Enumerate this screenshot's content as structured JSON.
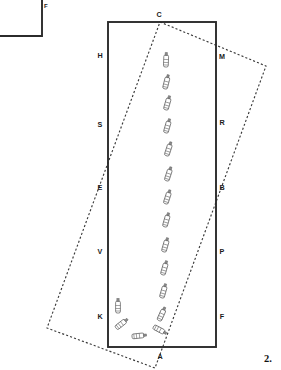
{
  "figure": {
    "number_label": "2.",
    "inset": {
      "corner_label": "F"
    },
    "labels": {
      "top": "C",
      "left_upper": "H",
      "left_second": "S",
      "left_mid": "E",
      "left_lower": "V",
      "left_bottom": "K",
      "bottom": "A",
      "right_upper": "M",
      "right_second": "R",
      "right_mid": "B",
      "right_lower": "P",
      "right_bottom": "F"
    },
    "colors": {
      "solid_outline": "#2b2b2b",
      "dashed_outline": "#3a3a3a",
      "vessel_stroke": "#4a4a4a",
      "vessel_fill": "#ffffff",
      "background": "#ffffff"
    },
    "geometry": {
      "solid_rect": {
        "x": 108,
        "y": 22,
        "width": 108,
        "height": 325
      },
      "inset_rect_path": "M -30 -12 L 44 -12 L 44 38 L -30 38 Z",
      "dashed_rect_points": "160,22 266,66 155,368 47,328",
      "vessel_track_points": [
        {
          "x": 166,
          "y": 62,
          "angle": 2
        },
        {
          "x": 166,
          "y": 84,
          "angle": 14
        },
        {
          "x": 167,
          "y": 105,
          "angle": 16
        },
        {
          "x": 167,
          "y": 128,
          "angle": 16
        },
        {
          "x": 168,
          "y": 151,
          "angle": 18
        },
        {
          "x": 168,
          "y": 176,
          "angle": 18
        },
        {
          "x": 167,
          "y": 199,
          "angle": 18
        },
        {
          "x": 166,
          "y": 222,
          "angle": 16
        },
        {
          "x": 165,
          "y": 247,
          "angle": 16
        },
        {
          "x": 164,
          "y": 270,
          "angle": 16
        },
        {
          "x": 163,
          "y": 293,
          "angle": 16
        },
        {
          "x": 161,
          "y": 316,
          "angle": 24
        }
      ],
      "vessel_turn_points": [
        {
          "x": 118,
          "y": 308,
          "angle": 0
        },
        {
          "x": 120,
          "y": 325,
          "angle": 52
        },
        {
          "x": 137,
          "y": 336,
          "angle": 84
        },
        {
          "x": 158,
          "y": 329,
          "angle": 118
        }
      ]
    }
  }
}
